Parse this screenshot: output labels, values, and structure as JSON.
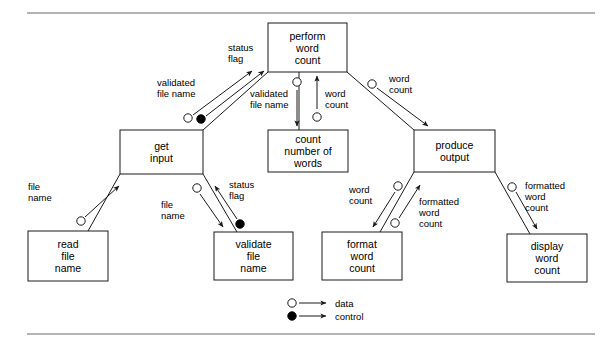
{
  "diagram": {
    "type": "structure-chart",
    "rules": [
      {
        "name": "top-rule",
        "x1": 27,
        "y1": 13,
        "x2": 595,
        "y2": 13
      },
      {
        "name": "bottom-rule",
        "x1": 27,
        "y1": 334,
        "x2": 595,
        "y2": 334
      }
    ],
    "modules": [
      {
        "id": "perform-word-count",
        "lines": [
          "perform",
          "word",
          "count"
        ],
        "x": 268,
        "y": 23,
        "w": 79,
        "h": 49
      },
      {
        "id": "get-input",
        "lines": [
          "get",
          "input"
        ],
        "x": 120,
        "y": 130,
        "w": 83,
        "h": 44
      },
      {
        "id": "count-number-of-words",
        "lines": [
          "count",
          "number of",
          "words"
        ],
        "x": 268,
        "y": 130,
        "w": 80,
        "h": 42
      },
      {
        "id": "produce-output",
        "lines": [
          "produce",
          "output"
        ],
        "x": 414,
        "y": 130,
        "w": 81,
        "h": 42
      },
      {
        "id": "read-file-name",
        "lines": [
          "read",
          "file",
          "name"
        ],
        "x": 28,
        "y": 231,
        "w": 80,
        "h": 50
      },
      {
        "id": "validate-file-name",
        "lines": [
          "validate",
          "file",
          "name"
        ],
        "x": 214,
        "y": 232,
        "w": 79,
        "h": 48
      },
      {
        "id": "format-word-count",
        "lines": [
          "format",
          "word",
          "count"
        ],
        "x": 322,
        "y": 232,
        "w": 80,
        "h": 48
      },
      {
        "id": "display-word-count",
        "lines": [
          "display",
          "word",
          "count"
        ],
        "x": 507,
        "y": 234,
        "w": 80,
        "h": 48
      }
    ],
    "couples": [
      {
        "id": "validated-file-name-up",
        "label_lines": [
          "validated",
          "file name"
        ],
        "label_x": 157,
        "label_y": 86,
        "label_anchor": "start",
        "kind": "data",
        "circle": {
          "cx": 188,
          "cy": 118
        },
        "arrow": {
          "x1": 193,
          "y1": 115,
          "x2": 252,
          "y2": 71
        }
      },
      {
        "id": "status-flag-up",
        "label_lines": [
          "status",
          "flag"
        ],
        "label_x": 228,
        "label_y": 51,
        "label_anchor": "start",
        "kind": "control",
        "circle": {
          "cx": 201,
          "cy": 119
        },
        "arrow": {
          "x1": 206,
          "y1": 116,
          "x2": 264,
          "y2": 71
        }
      },
      {
        "id": "validated-file-name-down",
        "label_lines": [
          "validated",
          "file name"
        ],
        "label_x": 250,
        "label_y": 97,
        "label_anchor": "start",
        "kind": "data",
        "circle": {
          "cx": 297,
          "cy": 82
        },
        "arrow": {
          "x1": 297,
          "y1": 90,
          "x2": 297,
          "y2": 126
        }
      },
      {
        "id": "word-count-up-to-perform",
        "label_lines": [
          "word",
          "count"
        ],
        "label_x": 325,
        "label_y": 97,
        "label_anchor": "start",
        "kind": "data",
        "circle": {
          "cx": 317,
          "cy": 117
        },
        "arrow": {
          "x1": 317,
          "y1": 109,
          "x2": 317,
          "y2": 76
        }
      },
      {
        "id": "word-count-to-produce",
        "label_lines": [
          "word",
          "count"
        ],
        "label_x": 389,
        "label_y": 82,
        "label_anchor": "start",
        "kind": "data",
        "circle": {
          "cx": 372,
          "cy": 84
        },
        "arrow": {
          "x1": 377,
          "y1": 88,
          "x2": 428,
          "y2": 126
        }
      },
      {
        "id": "file-name-read-to-get",
        "label_lines": [
          "file",
          "name"
        ],
        "label_x": 28,
        "label_y": 190,
        "label_anchor": "start",
        "kind": "data",
        "circle": {
          "cx": 81,
          "cy": 221
        },
        "arrow": {
          "x1": 85,
          "y1": 217,
          "x2": 119,
          "y2": 186
        }
      },
      {
        "id": "file-name-get-to-validate",
        "label_lines": [
          "file",
          "name"
        ],
        "label_x": 161,
        "label_y": 208,
        "label_anchor": "start",
        "kind": "data",
        "circle": {
          "cx": 197,
          "cy": 188
        },
        "arrow": {
          "x1": 200,
          "y1": 194,
          "x2": 223,
          "y2": 227
        }
      },
      {
        "id": "status-flag-validate-to-get",
        "label_lines": [
          "status",
          "flag"
        ],
        "label_x": 229,
        "label_y": 188,
        "label_anchor": "start",
        "kind": "control",
        "circle": {
          "cx": 240,
          "cy": 224
        },
        "arrow": {
          "x1": 237,
          "y1": 219,
          "x2": 215,
          "y2": 186
        }
      },
      {
        "id": "word-count-produce-to-format",
        "label_lines": [
          "word",
          "count"
        ],
        "label_x": 349,
        "label_y": 193,
        "label_anchor": "start",
        "kind": "data",
        "circle": {
          "cx": 398,
          "cy": 186
        },
        "arrow": {
          "x1": 395,
          "y1": 192,
          "x2": 373,
          "y2": 227
        }
      },
      {
        "id": "formatted-word-count-format-to-produce",
        "label_lines": [
          "formatted",
          "word",
          "count"
        ],
        "label_x": 419,
        "label_y": 205,
        "label_anchor": "start",
        "kind": "data",
        "circle": {
          "cx": 395,
          "cy": 223
        },
        "arrow": {
          "x1": 399,
          "y1": 218,
          "x2": 420,
          "y2": 185
        }
      },
      {
        "id": "formatted-word-count-produce-to-display",
        "label_lines": [
          "formatted",
          "word",
          "count"
        ],
        "label_x": 525,
        "label_y": 189,
        "label_anchor": "start",
        "kind": "data",
        "circle": {
          "cx": 512,
          "cy": 187
        },
        "arrow": {
          "x1": 516,
          "y1": 192,
          "x2": 537,
          "y2": 229
        }
      }
    ],
    "connections": [
      {
        "id": "perform-to-get-line",
        "x1": 268,
        "y1": 72,
        "x2": 203,
        "y2": 130
      },
      {
        "id": "perform-to-count-line",
        "x1": 299,
        "y1": 72,
        "x2": 299,
        "y2": 130
      },
      {
        "id": "perform-to-produce-line",
        "x1": 347,
        "y1": 72,
        "x2": 414,
        "y2": 130
      },
      {
        "id": "get-to-read-line",
        "x1": 120,
        "y1": 174,
        "x2": 88,
        "y2": 231
      },
      {
        "id": "get-to-validate-line",
        "x1": 203,
        "y1": 174,
        "x2": 237,
        "y2": 232
      },
      {
        "id": "produce-to-format-line",
        "x1": 414,
        "y1": 172,
        "x2": 380,
        "y2": 232
      },
      {
        "id": "produce-to-display-line",
        "x1": 495,
        "y1": 172,
        "x2": 530,
        "y2": 234
      }
    ],
    "legend": {
      "items": [
        {
          "id": "legend-data",
          "label": "data",
          "kind": "data",
          "cx": 292,
          "cy": 303,
          "line_x1": 299,
          "line_x2": 326,
          "text_x": 335
        },
        {
          "id": "legend-control",
          "label": "control",
          "kind": "control",
          "cx": 292,
          "cy": 316,
          "line_x1": 299,
          "line_x2": 326,
          "text_x": 335
        }
      ]
    },
    "colors": {
      "box_stroke": "#1a1a1a",
      "box_fill": "#ffffff",
      "rule": "#9a9a9a",
      "text": "#000000"
    }
  }
}
